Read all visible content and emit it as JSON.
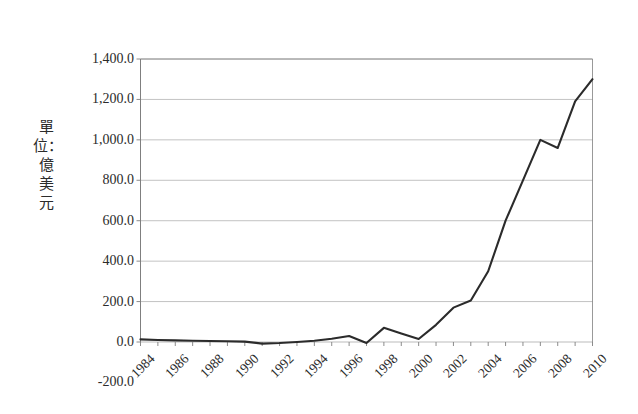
{
  "chart_data": {
    "type": "line",
    "title": "",
    "subtitle": "",
    "xlabel": "",
    "ylabel": "單位：億美元",
    "ylabel_chars": [
      "單",
      "位",
      "：",
      "億",
      "美",
      "元"
    ],
    "ylim": [
      -200,
      1400
    ],
    "ytick_labels": [
      "1,400.0",
      "1,200.0",
      "1,000.0",
      "800.0",
      "600.0",
      "400.0",
      "200.0",
      "0.0",
      "-200.0"
    ],
    "ytick_values": [
      1400,
      1200,
      1000,
      800,
      600,
      400,
      200,
      0,
      -200
    ],
    "grid": true,
    "grid_axis": "y",
    "legend": "none",
    "line_color": "#2b2b2b",
    "grid_color": "#b3b3b3",
    "axis_color": "#7f7f7f",
    "background_color": "#ffffff",
    "xtick_labels": [
      "1984",
      "1986",
      "1988",
      "1990",
      "1992",
      "1994",
      "1996",
      "1998",
      "2000",
      "2002",
      "2004",
      "2006",
      "2008",
      "2010"
    ],
    "x": [
      1984,
      1985,
      1986,
      1987,
      1988,
      1989,
      1990,
      1991,
      1992,
      1993,
      1994,
      1995,
      1996,
      1997,
      1998,
      1999,
      2000,
      2001,
      2002,
      2003,
      2004,
      2005,
      2006,
      2007,
      2008,
      2009,
      2010
    ],
    "values": [
      13,
      10,
      8,
      6,
      5,
      4,
      2,
      -8,
      -5,
      0,
      6,
      16,
      30,
      -5,
      70,
      42,
      15,
      85,
      170,
      205,
      350,
      600,
      800,
      1000,
      960,
      1190,
      1300
    ],
    "series": [
      {
        "name": "",
        "values": [
          13,
          10,
          8,
          6,
          5,
          4,
          2,
          -8,
          -5,
          0,
          6,
          16,
          30,
          -5,
          70,
          42,
          15,
          85,
          170,
          205,
          350,
          600,
          800,
          1000,
          960,
          1190,
          1300
        ]
      }
    ]
  }
}
